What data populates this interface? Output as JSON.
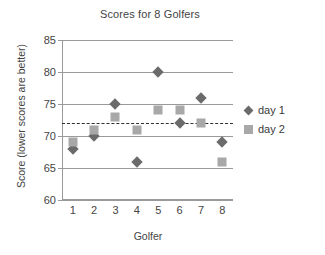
{
  "chart_data": {
    "type": "scatter",
    "title": "Scores for 8 Golfers",
    "xlabel": "Golfer",
    "ylabel": "Score (lower scores are better)",
    "categories": [
      "1",
      "2",
      "3",
      "4",
      "5",
      "6",
      "7",
      "8"
    ],
    "ylim": [
      60,
      85
    ],
    "yticks": [
      60,
      65,
      70,
      75,
      80,
      85
    ],
    "grid": true,
    "legend_position": "right",
    "series": [
      {
        "name": "day 1",
        "marker": "diamond",
        "color": "#6b6b6b",
        "values": [
          68,
          70,
          75,
          66,
          80,
          72,
          76,
          69
        ]
      },
      {
        "name": "day 2",
        "marker": "square",
        "color": "#a8a8a8",
        "values": [
          69,
          71,
          73,
          71,
          74,
          74,
          72,
          66
        ]
      }
    ],
    "annotations": [
      {
        "type": "reference-line",
        "orientation": "horizontal",
        "value": 72,
        "style": "dashed",
        "color": "#2f2f2f"
      }
    ]
  }
}
